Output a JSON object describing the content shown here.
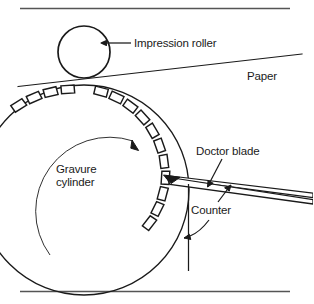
{
  "figure": {
    "kind": "technical-line-diagram",
    "width": 313,
    "height": 304,
    "background_color": "#ffffff",
    "line_color": "#1a1a1a",
    "rule_color": "#555555"
  },
  "labels": {
    "impression_roller": "Impression roller",
    "paper": "Paper",
    "gravure_cylinder": "Gravure\ncylinder",
    "gravure_cylinder_line1": "Gravure",
    "gravure_cylinder_line2": "cylinder",
    "doctor_blade": "Doctor blade",
    "counter": "Counter"
  },
  "parts": [
    {
      "name": "impression-roller",
      "label": "Impression roller",
      "shape": "circle",
      "cx": 84,
      "cy": 52,
      "r": 26
    },
    {
      "name": "paper",
      "label": "Paper",
      "shape": "line",
      "x1": 18,
      "y1": 86,
      "x2": 302,
      "y2": 54
    },
    {
      "name": "gravure-cylinder",
      "label": "Gravure cylinder",
      "shape": "circle",
      "cx": 84,
      "cy": 190,
      "r": 105,
      "engraved_cells": 14
    },
    {
      "name": "doctor-blade",
      "label": "Doctor blade",
      "shape": "tapered-blade",
      "tip_x": 185,
      "tip_y": 177
    },
    {
      "name": "counter",
      "label": "Counter",
      "shape": "vertical-line",
      "x": 188,
      "y1": 184,
      "y2": 270
    },
    {
      "name": "rotation-arrow",
      "label": "",
      "shape": "arc-arrow",
      "direction": "counter-clockwise"
    }
  ],
  "rules": {
    "top": {
      "y": 8,
      "x1": 20,
      "x2": 290
    },
    "bottom": {
      "y": 291,
      "x1": 20,
      "x2": 290
    }
  }
}
